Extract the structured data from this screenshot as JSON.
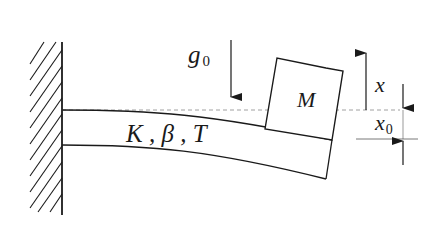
{
  "diagram": {
    "type": "mechanical-schematic",
    "colors": {
      "stroke": "#1a1a1a",
      "dashed_reference": "#888888",
      "background": "#ffffff"
    },
    "labels": {
      "gravity": "g",
      "gravity_sub": "0",
      "beam_props": "K , β , T",
      "mass": "M",
      "displacement": "x",
      "static_offset": "x",
      "static_offset_sub": "0"
    },
    "components": [
      {
        "id": "wall",
        "kind": "fixed-support",
        "hatched": true
      },
      {
        "id": "beam",
        "kind": "cantilever",
        "properties": [
          "K",
          "β",
          "T"
        ]
      },
      {
        "id": "mass",
        "kind": "block",
        "label": "M"
      },
      {
        "id": "gravity-arrow",
        "kind": "arrow",
        "direction": "down",
        "label": "g0"
      },
      {
        "id": "displacement-arrow",
        "kind": "arrow",
        "direction": "up",
        "label": "x"
      },
      {
        "id": "offset-dimension",
        "kind": "dimension",
        "label": "x0"
      },
      {
        "id": "equilibrium-line",
        "kind": "dashed-reference-line"
      }
    ]
  }
}
